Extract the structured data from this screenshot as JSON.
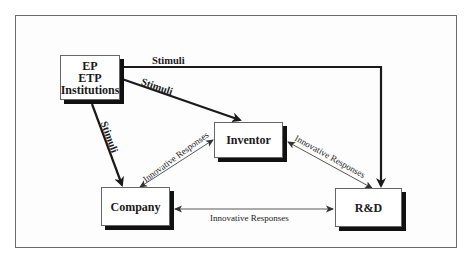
{
  "diagram": {
    "nodes": {
      "institutions": {
        "lines": [
          "EP",
          "ETP",
          "Institutions"
        ]
      },
      "inventor": {
        "label": "Inventor"
      },
      "company": {
        "label": "Company"
      },
      "rnd": {
        "label": "R&D"
      }
    },
    "edges": [
      {
        "from": "institutions",
        "to": "rnd",
        "label": "Stimuli",
        "style": "thick",
        "directed": "one-way"
      },
      {
        "from": "institutions",
        "to": "inventor",
        "label": "Stimuli",
        "style": "thick",
        "directed": "one-way"
      },
      {
        "from": "institutions",
        "to": "company",
        "label": "Stimuli",
        "style": "thick",
        "directed": "one-way"
      },
      {
        "from": "company",
        "to": "inventor",
        "label": "Innovative Responses",
        "style": "thin",
        "directed": "two-way"
      },
      {
        "from": "inventor",
        "to": "rnd",
        "label": "Innovative Responses",
        "style": "thin",
        "directed": "two-way"
      },
      {
        "from": "company",
        "to": "rnd",
        "label": "Innovative Responses",
        "style": "thin",
        "directed": "two-way"
      }
    ],
    "labels": {
      "stimuli_top": "Stimuli",
      "stimuli_diag": "Stimuli",
      "stimuli_vert": "Stimuli",
      "resp_company_inventor": "Innovative Responses",
      "resp_inventor_rnd": "Innovative Responses",
      "resp_company_rnd": "Innovative Responses"
    },
    "colors": {
      "line": "#1a1a1a",
      "thin_line": "#444444",
      "shadow": "#111111",
      "frame": "#6a6a6a"
    }
  }
}
